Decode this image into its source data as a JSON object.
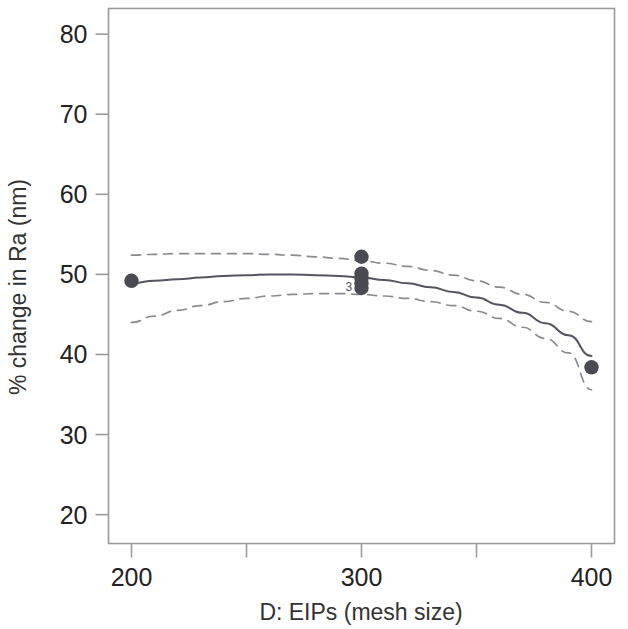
{
  "chart_data": {
    "type": "scatter",
    "title": "",
    "subtitle": "",
    "xlabel": "D: EIPs (mesh size)",
    "ylabel": "% change in Ra (nm)",
    "xlim": [
      190,
      410
    ],
    "ylim": [
      16.4,
      83.2
    ],
    "grid": false,
    "legend": null,
    "x_ticks": [
      200,
      300,
      400
    ],
    "x_tick_labels": [
      "200",
      "300",
      "400"
    ],
    "x_minor_ticks": [
      250,
      350
    ],
    "y_ticks": [
      20,
      30,
      40,
      50,
      60,
      70,
      80
    ],
    "y_tick_labels": [
      "20",
      "30",
      "40",
      "50",
      "60",
      "70",
      "80"
    ],
    "points": [
      {
        "x": 200,
        "y": 49.2,
        "label": ""
      },
      {
        "x": 300,
        "y": 52.2,
        "label": ""
      },
      {
        "x": 300,
        "y": 50.1,
        "label": ""
      },
      {
        "x": 300,
        "y": 49.5,
        "label": ""
      },
      {
        "x": 300,
        "y": 48.9,
        "label": ""
      },
      {
        "x": 300,
        "y": 48.3,
        "label": "3"
      },
      {
        "x": 400,
        "y": 38.4,
        "label": ""
      }
    ],
    "annotations": [
      {
        "text": "3",
        "x": 296,
        "y": 48.4
      }
    ],
    "series": [
      {
        "name": "fitted model",
        "style": "solid",
        "color": "#555560",
        "x": [
          200,
          210,
          220,
          230,
          240,
          250,
          260,
          270,
          280,
          290,
          300,
          310,
          320,
          330,
          340,
          350,
          360,
          370,
          380,
          390,
          400
        ],
        "values": [
          48.9,
          49.2,
          49.4,
          49.6,
          49.8,
          49.9,
          50.0,
          50.0,
          49.9,
          49.8,
          49.6,
          49.3,
          48.9,
          48.4,
          47.8,
          47.1,
          46.2,
          45.2,
          43.9,
          42.4,
          39.8
        ]
      },
      {
        "name": "upper confidence band",
        "style": "dashed",
        "color": "#8a8a92",
        "x": [
          200,
          210,
          220,
          230,
          240,
          250,
          260,
          270,
          280,
          290,
          300,
          310,
          320,
          330,
          340,
          350,
          360,
          370,
          380,
          390,
          400
        ],
        "values": [
          52.4,
          52.5,
          52.6,
          52.6,
          52.6,
          52.6,
          52.5,
          52.4,
          52.2,
          52.0,
          51.7,
          51.4,
          51.0,
          50.5,
          49.9,
          49.2,
          48.4,
          47.5,
          46.5,
          45.4,
          44.1
        ]
      },
      {
        "name": "lower confidence band",
        "style": "dashed",
        "color": "#8a8a92",
        "x": [
          200,
          210,
          220,
          230,
          240,
          250,
          260,
          270,
          280,
          290,
          300,
          310,
          320,
          330,
          340,
          350,
          360,
          370,
          380,
          390,
          400
        ],
        "values": [
          44.0,
          44.8,
          45.5,
          46.1,
          46.6,
          47.0,
          47.3,
          47.5,
          47.6,
          47.6,
          47.5,
          47.3,
          47.0,
          46.6,
          46.1,
          45.4,
          44.5,
          43.4,
          42.0,
          40.2,
          35.6
        ]
      }
    ],
    "colors": {
      "point_fill": "#4a4a52",
      "fit_line": "#555560",
      "band_line": "#8a8a92",
      "frame": "#9a9aa0",
      "background": "#ffffff",
      "text": "#222222"
    }
  }
}
